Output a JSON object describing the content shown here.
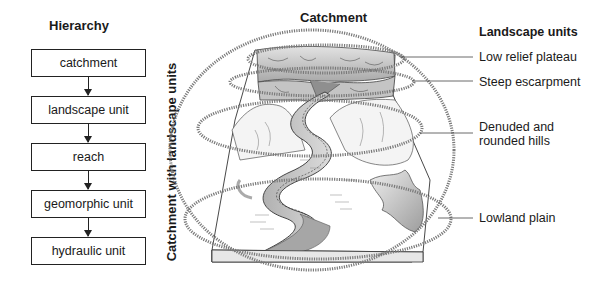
{
  "hierarchy": {
    "title": "Hierarchy",
    "levels": [
      "catchment",
      "landscape unit",
      "reach",
      "geomorphic unit",
      "hydraulic unit"
    ]
  },
  "figure": {
    "top_title": "Catchment",
    "side_title": "Catchment with landscape units"
  },
  "landscape_units": {
    "title": "Landscape units",
    "items": [
      {
        "label": "Low relief plateau"
      },
      {
        "label": "Steep escarpment"
      },
      {
        "label": "Denuded and",
        "label2": "rounded hills"
      },
      {
        "label": "Lowland plain"
      }
    ]
  },
  "colors": {
    "ink": "#222222",
    "dotted": "#7a7a7a",
    "shade_dark": "#9a9a9a",
    "shade_light": "#d6d6d6"
  }
}
